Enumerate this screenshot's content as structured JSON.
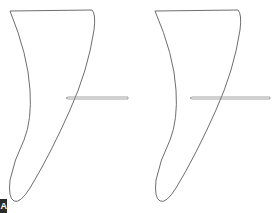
{
  "figure": {
    "panel_label": "A",
    "colors": {
      "outline": "#6e6e6e",
      "needle": "#8a8a8a",
      "background": "#ffffff",
      "label_bg": "#2b2b2b"
    },
    "shapes": [
      {
        "name": "root-outline-left",
        "path": "M10 11 L92 10 Q96 14 94 30 Q88 70 70 110 Q50 155 30 188 Q20 204 14 201 Q8 198 10 180 Q14 160 24 140 Q32 120 30 90 Q28 55 10 11 Z",
        "needle": {
          "x1": 68,
          "y1": 98,
          "x2": 128,
          "y2": 98,
          "tip_x": 66
        }
      },
      {
        "name": "root-outline-right",
        "path": "M155 11 L238 10 Q242 14 240 30 Q234 70 216 110 Q196 155 176 188 Q166 204 160 201 Q154 198 156 180 Q160 160 170 140 Q178 120 176 90 Q174 55 155 11 Z",
        "needle": {
          "x1": 192,
          "y1": 98,
          "x2": 270,
          "y2": 98,
          "tip_x": 190
        }
      }
    ]
  }
}
